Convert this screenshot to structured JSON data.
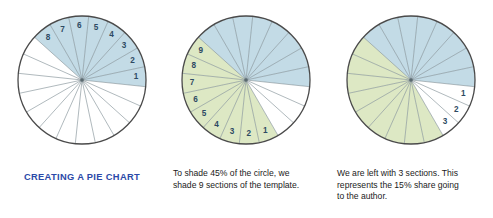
{
  "figure": {
    "sections_total": 20,
    "degrees_per_section": 18
  },
  "colors": {
    "blue_fill": "#c3dbe6",
    "green_fill": "#dde8c4",
    "white_fill": "#ffffff",
    "outline": "#4a4a4a",
    "spoke": "#7b8a90",
    "number_text": "#2e4a63",
    "caption_blue": "#2b49a8",
    "caption_black": "#1b1b1b"
  },
  "panels": [
    {
      "id": "panel-1",
      "name": "creating-a-pie-chart",
      "caption_lines": [
        "CREATING A PIE CHART"
      ],
      "caption_color": "#2b49a8",
      "shaded_blue_sections": 8,
      "shaded_green_sections": 0,
      "white_sections": 12,
      "labels": [
        "1",
        "2",
        "3",
        "4",
        "5",
        "6",
        "7",
        "8"
      ],
      "label_set": "blue"
    },
    {
      "id": "panel-2",
      "name": "shade-45-percent",
      "caption_lines": [
        "To shade 45% of the circle, we",
        "shade 9 sections of the template."
      ],
      "caption_color": "#1b1b1b",
      "shaded_blue_sections": 8,
      "shaded_green_sections": 9,
      "white_sections": 3,
      "labels": [
        "1",
        "2",
        "3",
        "4",
        "5",
        "6",
        "7",
        "8",
        "9"
      ],
      "label_set": "green"
    },
    {
      "id": "panel-3",
      "name": "remaining-three-sections",
      "caption_lines": [
        "We are left with 3 sections. This",
        "represents the 15% share going",
        "to the author."
      ],
      "caption_color": "#1b1b1b",
      "shaded_blue_sections": 8,
      "shaded_green_sections": 9,
      "white_sections": 3,
      "labels": [
        "1",
        "2",
        "3"
      ],
      "label_set": "white"
    }
  ],
  "chart_data": {
    "type": "pie",
    "title": "Creating a pie chart",
    "categories": [
      "Blue (publisher)",
      "Green (45% share)",
      "White (15% author share)"
    ],
    "values": [
      40,
      45,
      15
    ],
    "sections_total": 20,
    "section_value_percent": 5,
    "xlabel": "",
    "ylabel": "",
    "legend": "none",
    "annotations": [
      "CREATING A PIE CHART",
      "To shade 45% of the circle, we shade 9 sections of the template.",
      "We are left with 3 sections. This represents the 15% share going to the author."
    ],
    "series": [
      {
        "name": "panel-1",
        "blue": 8,
        "green": 0,
        "white": 12
      },
      {
        "name": "panel-2",
        "blue": 8,
        "green": 9,
        "white": 3
      },
      {
        "name": "panel-3",
        "blue": 8,
        "green": 9,
        "white": 3
      }
    ]
  }
}
